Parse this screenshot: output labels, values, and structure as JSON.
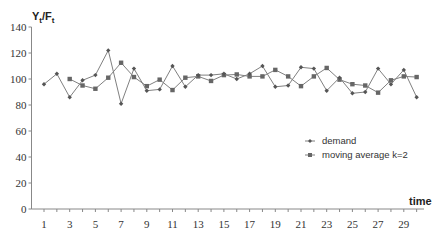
{
  "chart_data": {
    "type": "line",
    "title": "",
    "ylabel": "Yt/Ft",
    "xlabel": "time",
    "ylim": [
      0,
      140
    ],
    "yticks": [
      0,
      20,
      40,
      60,
      80,
      100,
      120,
      140
    ],
    "xticks_labeled": [
      1,
      3,
      5,
      7,
      9,
      11,
      13,
      15,
      17,
      19,
      21,
      23,
      25,
      27,
      29
    ],
    "x": [
      1,
      2,
      3,
      4,
      5,
      6,
      7,
      8,
      9,
      10,
      11,
      12,
      13,
      14,
      15,
      16,
      17,
      18,
      19,
      20,
      21,
      22,
      23,
      24,
      25,
      26,
      27,
      28,
      29,
      30
    ],
    "grid": false,
    "legend_position": "right-middle",
    "series": [
      {
        "name": "demand",
        "marker": "diamond",
        "x": [
          1,
          2,
          3,
          4,
          5,
          6,
          7,
          8,
          9,
          10,
          11,
          12,
          13,
          14,
          15,
          16,
          17,
          18,
          19,
          20,
          21,
          22,
          23,
          24,
          25,
          26,
          27,
          28,
          29,
          30
        ],
        "values": [
          96,
          104,
          86,
          99,
          103,
          122,
          81,
          108,
          91,
          92,
          110,
          94,
          103,
          103,
          104,
          100,
          104,
          110,
          94,
          95,
          109,
          108,
          91,
          101,
          89,
          90,
          108,
          96,
          107,
          86
        ]
      },
      {
        "name": "moving average k=2",
        "marker": "square",
        "x": [
          3,
          4,
          5,
          6,
          7,
          8,
          9,
          10,
          11,
          12,
          13,
          14,
          15,
          16,
          17,
          18,
          19,
          20,
          21,
          22,
          23,
          24,
          25,
          26,
          27,
          28,
          29,
          30
        ],
        "values": [
          100,
          95,
          92.5,
          101,
          112.5,
          101.5,
          94.5,
          99.5,
          91.5,
          101,
          102,
          98.5,
          103,
          103.5,
          102,
          102,
          107,
          102,
          94.5,
          102,
          108.5,
          99.5,
          96,
          95,
          89.5,
          99,
          102,
          101.5
        ]
      }
    ],
    "colors": {
      "line": "#808080",
      "marker": "#666666",
      "axis": "#888888"
    }
  },
  "labels": {
    "y_axis_title_main": "Y",
    "y_axis_title_sub1": "t",
    "y_axis_title_slash": "/F",
    "y_axis_title_sub2": "t",
    "x_axis_title": "time",
    "legend_demand": "demand",
    "legend_ma": "moving average k=2"
  }
}
